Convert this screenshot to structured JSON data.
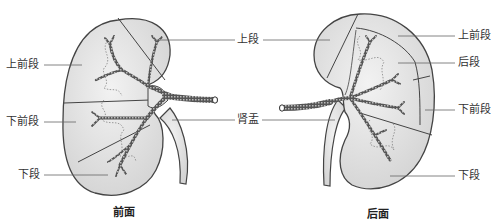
{
  "figure": {
    "colors": {
      "kidney_fill": "#e2e2e2",
      "outline": "#444444",
      "vessel": "#555555",
      "leader_line": "#666666",
      "text": "#333333"
    },
    "front_view": {
      "caption": "前面",
      "labels": {
        "upper_anterior": "上前段",
        "lower_anterior": "下前段",
        "lower": "下段",
        "upper": "上段",
        "pelvis": "肾盂"
      }
    },
    "back_view": {
      "caption": "后面",
      "labels": {
        "upper_anterior": "上前段",
        "posterior": "后段",
        "lower_anterior": "下前段",
        "lower": "下段"
      }
    }
  }
}
